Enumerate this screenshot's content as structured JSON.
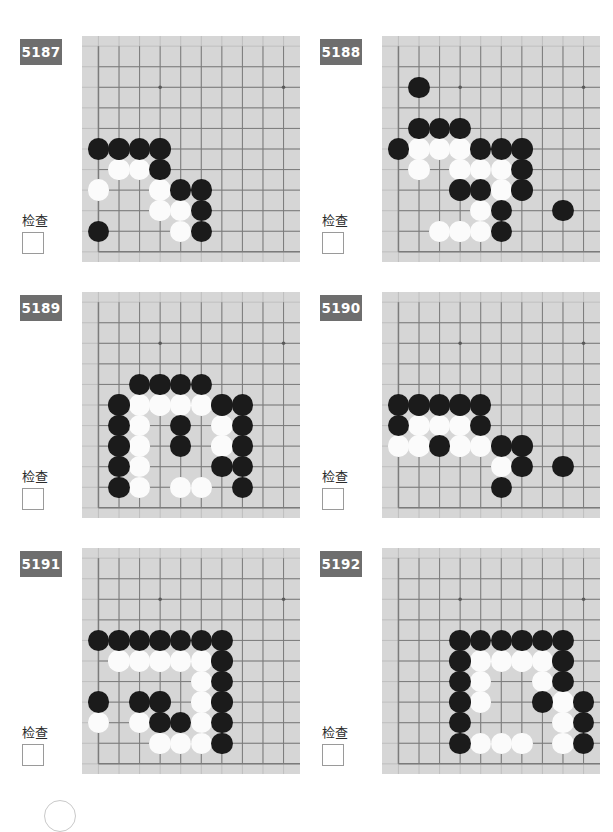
{
  "page": {
    "check_label": "检查",
    "columns": 2,
    "rows": 3
  },
  "board_style": {
    "background": "#d6d6d6",
    "line_color": "#7b7b7b",
    "thin_line_color": "#b5b5b5",
    "black_stone": "#1b1b1b",
    "white_stone": "#fbfbfb",
    "badge_background": "#6e6e6e",
    "badge_text": "#ffffff"
  },
  "problems": [
    {
      "id": "5187",
      "check_label": "检查",
      "checked": false,
      "board": {
        "cols": 10,
        "rows": 9,
        "edge_left": true,
        "edge_bottom": true,
        "star_points": [
          [
            3,
            1
          ],
          [
            9,
            1
          ]
        ],
        "black": [
          [
            0,
            4
          ],
          [
            1,
            4
          ],
          [
            2,
            4
          ],
          [
            3,
            4
          ],
          [
            3,
            5
          ],
          [
            4,
            6
          ],
          [
            5,
            6
          ],
          [
            5,
            7
          ],
          [
            0,
            8
          ],
          [
            5,
            8
          ]
        ],
        "white": [
          [
            1,
            5
          ],
          [
            2,
            5
          ],
          [
            0,
            6
          ],
          [
            3,
            6
          ],
          [
            3,
            7
          ],
          [
            4,
            7
          ],
          [
            4,
            8
          ]
        ]
      }
    },
    {
      "id": "5188",
      "check_label": "检查",
      "checked": false,
      "board": {
        "cols": 10,
        "rows": 9,
        "edge_left": true,
        "edge_bottom": true,
        "star_points": [
          [
            3,
            1
          ],
          [
            9,
            1
          ]
        ],
        "black": [
          [
            1,
            1
          ],
          [
            1,
            3
          ],
          [
            2,
            3
          ],
          [
            3,
            3
          ],
          [
            0,
            4
          ],
          [
            4,
            4
          ],
          [
            5,
            4
          ],
          [
            6,
            4
          ],
          [
            6,
            5
          ],
          [
            3,
            6
          ],
          [
            4,
            6
          ],
          [
            6,
            6
          ],
          [
            5,
            7
          ],
          [
            8,
            7
          ],
          [
            5,
            8
          ]
        ],
        "white": [
          [
            1,
            4
          ],
          [
            2,
            4
          ],
          [
            3,
            4
          ],
          [
            1,
            5
          ],
          [
            3,
            5
          ],
          [
            4,
            5
          ],
          [
            5,
            5
          ],
          [
            5,
            6
          ],
          [
            4,
            7
          ],
          [
            2,
            8
          ],
          [
            3,
            8
          ],
          [
            4,
            8
          ]
        ]
      }
    },
    {
      "id": "5189",
      "check_label": "检查",
      "checked": false,
      "board": {
        "cols": 10,
        "rows": 9,
        "edge_left": true,
        "edge_bottom": true,
        "star_points": [
          [
            3,
            1
          ],
          [
            9,
            1
          ]
        ],
        "black": [
          [
            2,
            3
          ],
          [
            3,
            3
          ],
          [
            4,
            3
          ],
          [
            5,
            3
          ],
          [
            1,
            4
          ],
          [
            6,
            4
          ],
          [
            7,
            4
          ],
          [
            1,
            5
          ],
          [
            4,
            5
          ],
          [
            7,
            5
          ],
          [
            1,
            6
          ],
          [
            4,
            6
          ],
          [
            7,
            6
          ],
          [
            1,
            7
          ],
          [
            6,
            7
          ],
          [
            7,
            7
          ],
          [
            1,
            8
          ],
          [
            7,
            8
          ]
        ],
        "white": [
          [
            2,
            4
          ],
          [
            3,
            4
          ],
          [
            4,
            4
          ],
          [
            5,
            4
          ],
          [
            2,
            5
          ],
          [
            6,
            5
          ],
          [
            2,
            6
          ],
          [
            6,
            6
          ],
          [
            2,
            7
          ],
          [
            6,
            7.0001
          ],
          [
            2,
            8
          ],
          [
            4,
            8
          ],
          [
            5,
            8
          ]
        ]
      }
    },
    {
      "id": "5190",
      "check_label": "检查",
      "checked": false,
      "board": {
        "cols": 10,
        "rows": 9,
        "edge_left": true,
        "edge_bottom": true,
        "star_points": [
          [
            3,
            1
          ],
          [
            9,
            1
          ]
        ],
        "black": [
          [
            0,
            4
          ],
          [
            1,
            4
          ],
          [
            2,
            4
          ],
          [
            3,
            4
          ],
          [
            4,
            4
          ],
          [
            0,
            5
          ],
          [
            4,
            5
          ],
          [
            2,
            6
          ],
          [
            5,
            6
          ],
          [
            6,
            6
          ],
          [
            6,
            7
          ],
          [
            8,
            7
          ],
          [
            5,
            8
          ]
        ],
        "white": [
          [
            1,
            5
          ],
          [
            2,
            5
          ],
          [
            3,
            5
          ],
          [
            0,
            6
          ],
          [
            1,
            6
          ],
          [
            3,
            6
          ],
          [
            4,
            6
          ],
          [
            5,
            7
          ]
        ]
      }
    },
    {
      "id": "5191",
      "check_label": "检查",
      "checked": false,
      "board": {
        "cols": 10,
        "rows": 9,
        "edge_left": true,
        "edge_bottom": true,
        "star_points": [
          [
            3,
            1
          ],
          [
            9,
            1
          ]
        ],
        "black": [
          [
            0,
            3
          ],
          [
            1,
            3
          ],
          [
            2,
            3
          ],
          [
            3,
            3
          ],
          [
            4,
            3
          ],
          [
            5,
            3
          ],
          [
            6,
            3
          ],
          [
            6,
            4
          ],
          [
            6,
            5
          ],
          [
            0,
            6
          ],
          [
            2,
            6
          ],
          [
            3,
            6
          ],
          [
            6,
            6
          ],
          [
            3,
            7
          ],
          [
            4,
            7
          ],
          [
            6,
            7
          ],
          [
            6,
            8
          ]
        ],
        "white": [
          [
            1,
            4
          ],
          [
            2,
            4
          ],
          [
            3,
            4
          ],
          [
            4,
            4
          ],
          [
            5,
            4
          ],
          [
            5,
            5
          ],
          [
            5,
            6
          ],
          [
            0,
            7
          ],
          [
            2,
            7
          ],
          [
            5,
            7
          ],
          [
            3,
            8
          ],
          [
            4,
            8
          ],
          [
            5,
            8
          ]
        ]
      }
    },
    {
      "id": "5192",
      "check_label": "检查",
      "checked": false,
      "board": {
        "cols": 10,
        "rows": 9,
        "edge_left": true,
        "edge_bottom": true,
        "star_points": [
          [
            3,
            1
          ],
          [
            9,
            1
          ]
        ],
        "black": [
          [
            3,
            3
          ],
          [
            4,
            3
          ],
          [
            5,
            3
          ],
          [
            6,
            3
          ],
          [
            7,
            3
          ],
          [
            8,
            3
          ],
          [
            3,
            4
          ],
          [
            8,
            4
          ],
          [
            3,
            5
          ],
          [
            8,
            5
          ],
          [
            3,
            6
          ],
          [
            7,
            6
          ],
          [
            9,
            6
          ],
          [
            3,
            7
          ],
          [
            9,
            7
          ],
          [
            3,
            8
          ],
          [
            9,
            8
          ]
        ],
        "white": [
          [
            4,
            4
          ],
          [
            5,
            4
          ],
          [
            6,
            4
          ],
          [
            7,
            4
          ],
          [
            4,
            5
          ],
          [
            7,
            5
          ],
          [
            4,
            6
          ],
          [
            8,
            6
          ],
          [
            8,
            7
          ],
          [
            4,
            8
          ],
          [
            5,
            8
          ],
          [
            6,
            8
          ],
          [
            8,
            8
          ]
        ]
      }
    }
  ]
}
